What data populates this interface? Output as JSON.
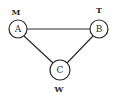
{
  "diagram": {
    "nodes": [
      {
        "id": "A",
        "label": "A",
        "tag": "M"
      },
      {
        "id": "B",
        "label": "B",
        "tag": "T"
      },
      {
        "id": "C",
        "label": "C",
        "tag": "W"
      }
    ],
    "edges": [
      {
        "from": "A",
        "to": "B"
      },
      {
        "from": "A",
        "to": "C"
      },
      {
        "from": "B",
        "to": "C"
      }
    ],
    "colors": {
      "stroke": "#2a2a2a",
      "fill": "#ffffff"
    }
  }
}
